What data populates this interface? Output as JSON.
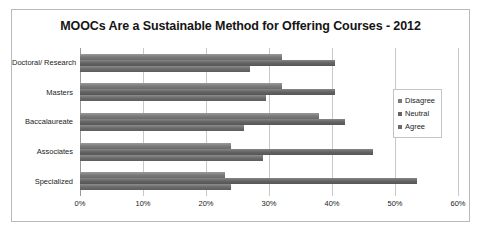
{
  "chart_data": {
    "type": "bar",
    "orientation": "horizontal",
    "title": "MOOCs Are a Sustainable Method for Offering Courses - 2012",
    "xlabel": "",
    "ylabel": "",
    "categories": [
      "Doctoral/ Research",
      "Masters",
      "Baccalaureate",
      "Associates",
      "Specialized"
    ],
    "series": [
      {
        "name": "Disagree",
        "values": [
          32,
          32,
          38,
          24,
          23
        ]
      },
      {
        "name": "Neutral",
        "values": [
          40.5,
          40.5,
          42,
          46.5,
          53.5
        ]
      },
      {
        "name": "Agree",
        "values": [
          27,
          29.5,
          26,
          29,
          24
        ]
      }
    ],
    "xlim": [
      0,
      60
    ],
    "xticks": [
      0,
      10,
      20,
      30,
      40,
      50,
      60
    ],
    "xtick_labels": [
      "0%",
      "10%",
      "20%",
      "30%",
      "40%",
      "50%",
      "60%"
    ],
    "grid": true,
    "legend_position": "right",
    "colors": {
      "disagree": "#7a7a7a",
      "neutral": "#636363",
      "agree": "#6b6b6b",
      "gridline": "#c8c8c8",
      "border": "#b9b9b9"
    }
  }
}
